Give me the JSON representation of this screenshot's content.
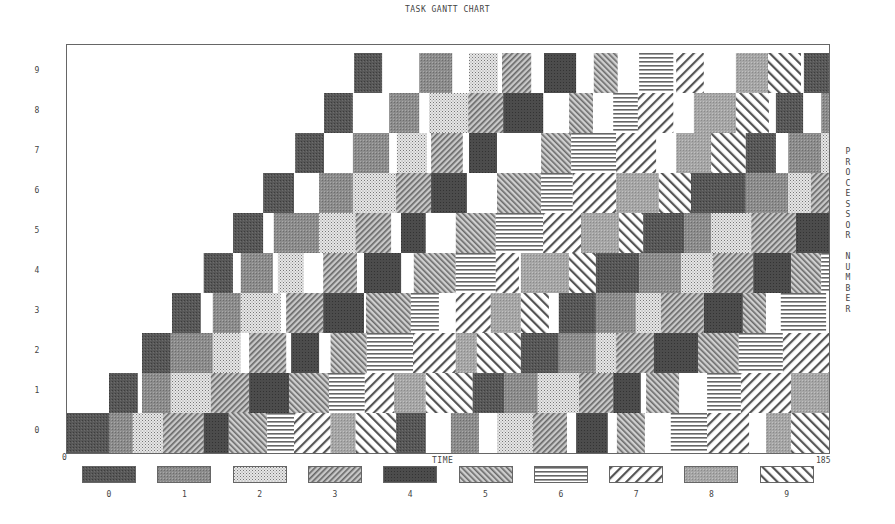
{
  "chart_data": {
    "type": "gantt",
    "title": "TASK GANTT CHART",
    "xlabel": "TIME",
    "ylabel": "PROCESSOR NUMBER",
    "xlim": [
      0,
      185
    ],
    "x_ticks": [
      "0",
      "185"
    ],
    "y_ticks": [
      "0",
      "1",
      "2",
      "3",
      "4",
      "5",
      "6",
      "7",
      "8",
      "9"
    ],
    "legend": [
      "0",
      "1",
      "2",
      "3",
      "4",
      "5",
      "6",
      "7",
      "8",
      "9"
    ],
    "legend_position": "bottom",
    "grid": false,
    "series_note": "Each processor row contains task blocks [start, end, task_id] in time units",
    "rows": [
      {
        "processor": 0,
        "blocks": [
          [
            0,
            10.2,
            0
          ],
          [
            10.2,
            16,
            1
          ],
          [
            16,
            23.3,
            2
          ],
          [
            23.3,
            33.2,
            3
          ],
          [
            33.2,
            39.3,
            4
          ],
          [
            39.3,
            48.6,
            5
          ],
          [
            48.6,
            55.1,
            6
          ],
          [
            55.1,
            64,
            7
          ],
          [
            64,
            70.1,
            8
          ],
          [
            70.1,
            79.9,
            9
          ],
          [
            79.9,
            87.1,
            0
          ],
          [
            93.2,
            100,
            1
          ],
          [
            104.4,
            113.1,
            2
          ],
          [
            113.1,
            121.4,
            3
          ],
          [
            123.6,
            131.3,
            4
          ],
          [
            133.5,
            140.3,
            5
          ],
          [
            146.6,
            155.4,
            6
          ],
          [
            155.4,
            165.6,
            7
          ],
          [
            169.7,
            175.8,
            8
          ],
          [
            175.8,
            185,
            9
          ]
        ]
      },
      {
        "processor": 1,
        "blocks": [
          [
            10.2,
            17.2,
            0
          ],
          [
            18.2,
            25.2,
            1
          ],
          [
            25.2,
            34.9,
            2
          ],
          [
            34.9,
            44.2,
            3
          ],
          [
            44.2,
            53.9,
            4
          ],
          [
            53.9,
            63.6,
            5
          ],
          [
            63.6,
            72.3,
            6
          ],
          [
            72.3,
            79.4,
            7
          ],
          [
            79.4,
            87.1,
            8
          ],
          [
            87.1,
            98.5,
            9
          ],
          [
            98.5,
            106.1,
            0
          ],
          [
            106.1,
            114.3,
            1
          ],
          [
            114.3,
            124.3,
            2
          ],
          [
            124.3,
            132.6,
            3
          ],
          [
            132.6,
            139.3,
            4
          ],
          [
            140.6,
            148.6,
            5
          ],
          [
            155.4,
            163.6,
            6
          ],
          [
            163.6,
            175.8,
            7
          ],
          [
            175.8,
            185,
            8
          ]
        ]
      },
      {
        "processor": 2,
        "blocks": [
          [
            18.2,
            25.2,
            0
          ],
          [
            25.2,
            35.4,
            1
          ],
          [
            35.4,
            42.2,
            2
          ],
          [
            44.2,
            53.2,
            3
          ],
          [
            54.4,
            61.2,
            4
          ],
          [
            64,
            72.8,
            5
          ],
          [
            72.8,
            84,
            6
          ],
          [
            84,
            94.4,
            7
          ],
          [
            94.4,
            99.5,
            8
          ],
          [
            99.5,
            110.2,
            9
          ],
          [
            110.2,
            119.4,
            0
          ],
          [
            119.4,
            128.4,
            1
          ],
          [
            128.4,
            133.3,
            2
          ],
          [
            133.3,
            142.5,
            3
          ],
          [
            142.5,
            153.2,
            4
          ],
          [
            153.2,
            163.1,
            5
          ],
          [
            163.1,
            173.8,
            6
          ],
          [
            173.8,
            185,
            7
          ]
        ]
      },
      {
        "processor": 3,
        "blocks": [
          [
            25.5,
            32.5,
            0
          ],
          [
            35.4,
            42.2,
            1
          ],
          [
            42.2,
            51.9,
            2
          ],
          [
            53.2,
            62.2,
            3
          ],
          [
            62.2,
            72.1,
            4
          ],
          [
            72.6,
            83.5,
            5
          ],
          [
            83.5,
            90.3,
            6
          ],
          [
            94.4,
            102.9,
            7
          ],
          [
            102.9,
            110.2,
            8
          ],
          [
            110.2,
            117,
            9
          ],
          [
            119.4,
            128.4,
            0
          ],
          [
            128.4,
            138.1,
            1
          ],
          [
            138.1,
            144.2,
            2
          ],
          [
            144.2,
            154.6,
            3
          ],
          [
            154.6,
            164.1,
            4
          ],
          [
            164.1,
            169.7,
            5
          ],
          [
            173.3,
            184.3,
            6
          ]
        ]
      },
      {
        "processor": 4,
        "blocks": [
          [
            33.2,
            40.3,
            0
          ],
          [
            42.2,
            50,
            1
          ],
          [
            51.2,
            57.5,
            2
          ],
          [
            62.2,
            70.4,
            3
          ],
          [
            72.1,
            81.1,
            4
          ],
          [
            84.2,
            94.4,
            5
          ],
          [
            94.4,
            104.1,
            6
          ],
          [
            104.1,
            109.7,
            7
          ],
          [
            110.2,
            121.9,
            8
          ],
          [
            121.9,
            128.4,
            9
          ],
          [
            128.4,
            138.9,
            0
          ],
          [
            138.9,
            149.1,
            1
          ],
          [
            149.1,
            156.8,
            2
          ],
          [
            156.8,
            166.6,
            3
          ],
          [
            166.6,
            175.8,
            4
          ],
          [
            175.8,
            183.1,
            5
          ],
          [
            183.1,
            185,
            6
          ]
        ]
      },
      {
        "processor": 5,
        "blocks": [
          [
            40.3,
            47.6,
            0
          ],
          [
            50.2,
            61.2,
            1
          ],
          [
            61.2,
            70.1,
            2
          ],
          [
            70.1,
            78.7,
            3
          ],
          [
            81.1,
            87.1,
            4
          ],
          [
            94.4,
            104.1,
            5
          ],
          [
            104.1,
            115.6,
            6
          ],
          [
            115.6,
            124.8,
            7
          ],
          [
            124.8,
            134,
            8
          ],
          [
            134,
            139.9,
            9
          ],
          [
            139.9,
            149.8,
            0
          ],
          [
            149.8,
            156.4,
            1
          ],
          [
            156.4,
            166.1,
            2
          ],
          [
            166.1,
            177,
            3
          ],
          [
            177,
            185,
            4
          ]
        ]
      },
      {
        "processor": 6,
        "blocks": [
          [
            47.6,
            55.1,
            0
          ],
          [
            61.2,
            69.4,
            1
          ],
          [
            69.4,
            79.9,
            2
          ],
          [
            79.9,
            88.4,
            3
          ],
          [
            88.4,
            97.1,
            4
          ],
          [
            104.4,
            115.1,
            5
          ],
          [
            115.1,
            122.8,
            6
          ],
          [
            122.8,
            133.3,
            7
          ],
          [
            133.3,
            143.7,
            8
          ],
          [
            143.7,
            151.5,
            9
          ],
          [
            151.5,
            164.8,
            0
          ],
          [
            164.8,
            175.1,
            1
          ],
          [
            175.1,
            180.6,
            2
          ],
          [
            180.6,
            185,
            3
          ]
        ]
      },
      {
        "processor": 7,
        "blocks": [
          [
            55.4,
            62.4,
            0
          ],
          [
            69.4,
            78.2,
            1
          ],
          [
            80.1,
            87.4,
            2
          ],
          [
            88.4,
            96.1,
            3
          ],
          [
            97.6,
            104.4,
            4
          ],
          [
            115.1,
            122.4,
            5
          ],
          [
            122.4,
            133.3,
            6
          ],
          [
            133.3,
            143,
            7
          ],
          [
            147.9,
            156.4,
            8
          ],
          [
            156.4,
            164.8,
            9
          ],
          [
            164.8,
            172.1,
            0
          ],
          [
            175.1,
            183.1,
            1
          ],
          [
            183.1,
            185,
            2
          ]
        ]
      },
      {
        "processor": 8,
        "blocks": [
          [
            62.4,
            69.4,
            0
          ],
          [
            78.2,
            85.5,
            1
          ],
          [
            87.9,
            97.4,
            2
          ],
          [
            97.4,
            105.9,
            3
          ],
          [
            105.9,
            115.6,
            4
          ],
          [
            121.9,
            127.7,
            5
          ],
          [
            132.6,
            138.6,
            6
          ],
          [
            138.6,
            147.2,
            7
          ],
          [
            152.2,
            162.4,
            8
          ],
          [
            162.4,
            170.4,
            9
          ],
          [
            172.1,
            178.7,
            0
          ],
          [
            183.1,
            185,
            1
          ]
        ]
      },
      {
        "processor": 9,
        "blocks": [
          [
            69.7,
            76.5,
            0
          ],
          [
            85.5,
            93.5,
            1
          ],
          [
            97.6,
            104.6,
            2
          ],
          [
            105.6,
            112.7,
            3
          ],
          [
            115.8,
            123.6,
            4
          ],
          [
            127.9,
            133.7,
            5
          ],
          [
            138.9,
            147.2,
            6
          ],
          [
            147.9,
            154.6,
            7
          ],
          [
            162.4,
            170.2,
            8
          ],
          [
            170.2,
            178.2,
            9
          ],
          [
            178.9,
            185,
            0
          ]
        ]
      }
    ]
  },
  "patterns": {
    "0": {
      "fill": "#555555",
      "kind": "solid-dark"
    },
    "1": {
      "fill": "#8a8a8a",
      "kind": "solid-mid"
    },
    "2": {
      "fill": "#d4d4d4",
      "kind": "dots-light"
    },
    "3": {
      "fill": "#9a9a9a",
      "kind": "fine-diag-right"
    },
    "4": {
      "fill": "#505050",
      "kind": "solid-darker"
    },
    "5": {
      "fill": "#a5a5a5",
      "kind": "fine-diag-left"
    },
    "6": {
      "fill": "#ffffff",
      "kind": "horizontal-lines"
    },
    "7": {
      "fill": "#ffffff",
      "kind": "wide-diag-right"
    },
    "8": {
      "fill": "#a0a0a0",
      "kind": "solid-light"
    },
    "9": {
      "fill": "#ffffff",
      "kind": "wide-diag-left"
    }
  }
}
